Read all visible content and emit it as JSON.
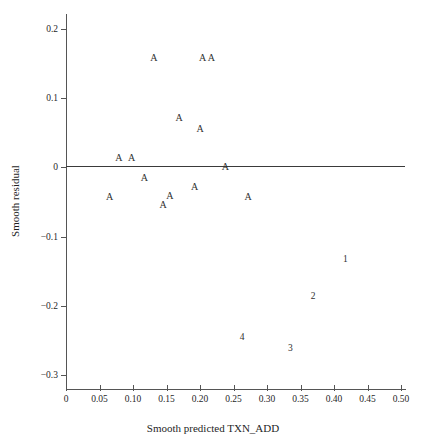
{
  "chart_data": {
    "type": "scatter",
    "title": "",
    "xlabel": "Smooth predicted TXN_ADD",
    "ylabel": "Smooth residual",
    "xlim": [
      0.0,
      0.5
    ],
    "ylim": [
      -0.32,
      0.22
    ],
    "xticks": [
      "0",
      "0.05",
      "0.10",
      "0.15",
      "0.20",
      "0.25",
      "0.30",
      "0.35",
      "0.40",
      "0.45",
      "0.50"
    ],
    "xtick_values": [
      0.0,
      0.05,
      0.1,
      0.15,
      0.2,
      0.25,
      0.3,
      0.35,
      0.4,
      0.45,
      0.5
    ],
    "yticks": [
      "0.2",
      "0.1",
      "0",
      "−0.1",
      "−0.2",
      "−0.3"
    ],
    "ytick_values": [
      0.2,
      0.1,
      0.0,
      -0.1,
      -0.2,
      -0.3
    ],
    "grid": false,
    "legend": "none",
    "reference_line": {
      "name": "zero-residual-line",
      "y": 0.0,
      "color": "#3a3a3a"
    },
    "points": [
      {
        "label": "A",
        "x": 0.131,
        "y": 0.158
      },
      {
        "label": "A",
        "x": 0.204,
        "y": 0.158
      },
      {
        "label": "A",
        "x": 0.217,
        "y": 0.158
      },
      {
        "label": "A",
        "x": 0.169,
        "y": 0.071
      },
      {
        "label": "A",
        "x": 0.2,
        "y": 0.056
      },
      {
        "label": "A",
        "x": 0.079,
        "y": 0.014
      },
      {
        "label": "A",
        "x": 0.098,
        "y": 0.014
      },
      {
        "label": "A",
        "x": 0.238,
        "y": 0.0
      },
      {
        "label": "A",
        "x": 0.117,
        "y": -0.016
      },
      {
        "label": "A",
        "x": 0.192,
        "y": -0.028
      },
      {
        "label": "A",
        "x": 0.065,
        "y": -0.043
      },
      {
        "label": "A",
        "x": 0.155,
        "y": -0.041
      },
      {
        "label": "A",
        "x": 0.272,
        "y": -0.043
      },
      {
        "label": "A",
        "x": 0.145,
        "y": -0.055
      },
      {
        "label": "1",
        "x": 0.417,
        "y": -0.133
      },
      {
        "label": "2",
        "x": 0.369,
        "y": -0.186
      },
      {
        "label": "4",
        "x": 0.263,
        "y": -0.245
      },
      {
        "label": "3",
        "x": 0.335,
        "y": -0.261
      }
    ]
  },
  "colors": {
    "axis": "#555555",
    "marker": "#2f2f2f",
    "reference_line": "#3a3a3a",
    "background": "#ffffff"
  }
}
